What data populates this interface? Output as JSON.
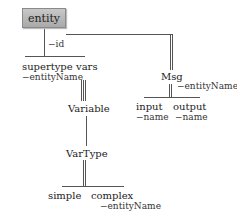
{
  "diagram": {
    "root": {
      "label": "entity",
      "attribute": "−id"
    },
    "nodes": {
      "supertype": {
        "label": "supertype",
        "attribute": "−entityName"
      },
      "vars": {
        "label": "vars"
      },
      "variable": {
        "label": "Variable"
      },
      "vartype": {
        "label": "VarType"
      },
      "simple": {
        "label": "simple"
      },
      "complex": {
        "label": "complex",
        "attribute": "−entityName"
      },
      "msg": {
        "label": "Msg",
        "attribute": "−entityName"
      },
      "input": {
        "label": "input",
        "attribute": "−name"
      },
      "output": {
        "label": "output",
        "attribute": "−name"
      }
    },
    "edges": [
      {
        "from": "entity",
        "to": [
          "supertype",
          "vars"
        ],
        "style": "single"
      },
      {
        "from": "entity",
        "to": [
          "msg"
        ],
        "style": "double"
      },
      {
        "from": "vars",
        "to": [
          "variable"
        ],
        "style": "triple"
      },
      {
        "from": "variable",
        "to": [
          "vartype"
        ],
        "style": "single"
      },
      {
        "from": "vartype",
        "to": [
          "simple",
          "complex"
        ],
        "style": "double"
      },
      {
        "from": "msg",
        "to": [
          "input",
          "output"
        ],
        "style": "double"
      }
    ]
  }
}
